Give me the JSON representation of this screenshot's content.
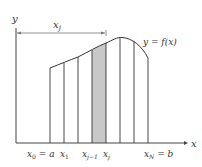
{
  "figure": {
    "axes": {
      "x_label": "x",
      "y_label": "y"
    },
    "curve_label": "y = f(x)",
    "width_marker_label": "x_j",
    "tick_labels": [
      {
        "id": "x0",
        "text": "x₀ = a"
      },
      {
        "id": "x1",
        "text": "x₁"
      },
      {
        "id": "xjm1",
        "text": "xⱼ₋₁"
      },
      {
        "id": "xj",
        "text": "xⱼ"
      },
      {
        "id": "xN",
        "text": "x_N = b"
      }
    ],
    "partition_x_pixels": [
      50,
      64,
      78,
      92,
      106,
      120,
      134,
      148
    ],
    "curve_y_pixels": [
      68,
      63,
      57,
      50,
      43,
      38,
      41,
      58
    ],
    "shaded_interval": {
      "from": "x_{j-1}",
      "to": "x_j"
    },
    "colors": {
      "line": "#333333",
      "axis": "#444444",
      "shade": "#c8c8c8",
      "arrow": "#555555"
    }
  }
}
